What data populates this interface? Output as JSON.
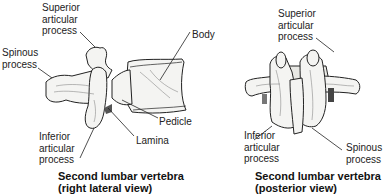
{
  "figures": [
    {
      "id": "lateral",
      "caption": {
        "line1": "Second lumbar vertebra",
        "line2": "(right lateral view)"
      },
      "labels": {
        "superior_articular_process": "Superior\narticular\nprocess",
        "spinous_process": "Spinous\nprocess",
        "body": "Body",
        "pedicle": "Pedicle",
        "lamina": "Lamina",
        "inferior_articular_process": "Inferior\narticular\nprocess"
      }
    },
    {
      "id": "posterior",
      "caption": {
        "line1": "Second lumbar vertebra",
        "line2": "(posterior view)"
      },
      "labels": {
        "superior_articular_process": "Superior\narticular\nprocess",
        "inferior_articular_process": "Inferior\narticular\nprocess",
        "spinous_process": "Spinous\nprocess"
      }
    }
  ],
  "colors": {
    "line": "#222222",
    "bone_fill": "#f4f4f2",
    "shade": "#b9b9b5"
  }
}
